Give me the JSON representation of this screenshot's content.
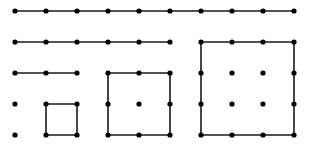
{
  "diagram": {
    "colors": {
      "line": "#1a1a1a",
      "dot": "#000000",
      "background": "#ffffff"
    },
    "grid": {
      "columns_x": [
        15,
        46,
        77,
        108,
        139,
        170,
        201,
        232,
        263,
        294
      ],
      "rows_y": [
        11,
        42,
        73,
        104,
        135
      ]
    },
    "lines": [
      {
        "name": "row1-line",
        "points": [
          [
            15,
            11
          ],
          [
            294,
            11
          ]
        ]
      },
      {
        "name": "row2-line",
        "points": [
          [
            15,
            42
          ],
          [
            170,
            42
          ]
        ]
      },
      {
        "name": "row3-line",
        "points": [
          [
            15,
            73
          ],
          [
            77,
            73
          ]
        ]
      },
      {
        "name": "small-square",
        "points": [
          [
            46,
            104
          ],
          [
            77,
            104
          ],
          [
            77,
            135
          ],
          [
            46,
            135
          ],
          [
            46,
            104
          ]
        ]
      },
      {
        "name": "medium-square",
        "points": [
          [
            108,
            73
          ],
          [
            170,
            73
          ],
          [
            170,
            135
          ],
          [
            108,
            135
          ],
          [
            108,
            73
          ]
        ]
      },
      {
        "name": "large-square",
        "points": [
          [
            201,
            42
          ],
          [
            294,
            42
          ],
          [
            294,
            135
          ],
          [
            201,
            135
          ],
          [
            201,
            42
          ]
        ]
      }
    ],
    "dots": [
      [
        15,
        11
      ],
      [
        46,
        11
      ],
      [
        77,
        11
      ],
      [
        108,
        11
      ],
      [
        139,
        11
      ],
      [
        170,
        11
      ],
      [
        201,
        11
      ],
      [
        232,
        11
      ],
      [
        263,
        11
      ],
      [
        294,
        11
      ],
      [
        15,
        42
      ],
      [
        46,
        42
      ],
      [
        77,
        42
      ],
      [
        108,
        42
      ],
      [
        139,
        42
      ],
      [
        170,
        42
      ],
      [
        15,
        73
      ],
      [
        46,
        73
      ],
      [
        77,
        73
      ],
      [
        15,
        104
      ],
      [
        15,
        135
      ],
      [
        46,
        104
      ],
      [
        77,
        104
      ],
      [
        46,
        135
      ],
      [
        77,
        135
      ],
      [
        108,
        73
      ],
      [
        139,
        73
      ],
      [
        170,
        73
      ],
      [
        108,
        104
      ],
      [
        139,
        104
      ],
      [
        170,
        104
      ],
      [
        108,
        135
      ],
      [
        139,
        135
      ],
      [
        170,
        135
      ],
      [
        201,
        42
      ],
      [
        232,
        42
      ],
      [
        263,
        42
      ],
      [
        294,
        42
      ],
      [
        201,
        73
      ],
      [
        232,
        73
      ],
      [
        263,
        73
      ],
      [
        294,
        73
      ],
      [
        201,
        104
      ],
      [
        232,
        104
      ],
      [
        263,
        104
      ],
      [
        294,
        104
      ],
      [
        201,
        135
      ],
      [
        232,
        135
      ],
      [
        263,
        135
      ],
      [
        294,
        135
      ]
    ]
  }
}
